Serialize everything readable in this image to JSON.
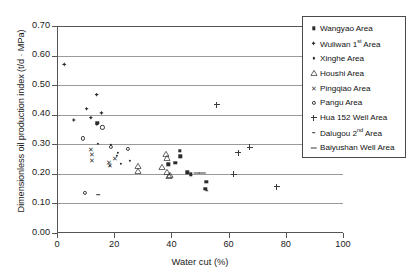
{
  "chart": {
    "type": "scatter",
    "title": "",
    "xlabel": "Water cut (%)",
    "ylabel": "Dimensionless oil production index (t/d · MPa)",
    "xlim": [
      0,
      100
    ],
    "ylim": [
      0.0,
      0.7
    ],
    "xticks": [
      "0",
      "20",
      "40",
      "60",
      "80",
      "100"
    ],
    "yticks": [
      "0.00",
      "0.10",
      "0.20",
      "0.30",
      "0.40",
      "0.50",
      "0.60",
      "0.70"
    ],
    "grid": "horizontal",
    "legend_position": "top-right"
  },
  "legend": {
    "items": [
      {
        "label": "Wangyao Area",
        "marker": "filled-square",
        "key": "wangyao"
      },
      {
        "label": "Wuliwan 1",
        "sup": "st",
        "label_tail": " Area",
        "marker": "filled-diamond",
        "key": "wuliwan"
      },
      {
        "label": "Xinghe Area",
        "marker": "small-dot",
        "key": "xinghe"
      },
      {
        "label": "Houshi Area",
        "marker": "open-triangle",
        "key": "houshi"
      },
      {
        "label": "Pingqiao Area",
        "marker": "x-cross",
        "key": "pingqiao"
      },
      {
        "label": "Pangu Area",
        "marker": "open-circle",
        "key": "pangu"
      },
      {
        "label": "Hua 152 Well Area",
        "marker": "plus",
        "key": "hua152"
      },
      {
        "label": "Dalugou 2",
        "sup": "nd",
        "label_tail": " Area",
        "marker": "short-dash",
        "key": "dalugou"
      },
      {
        "label": "Baiyushan Well Area",
        "marker": "long-dash",
        "key": "baiyushan"
      }
    ]
  },
  "chart_data": {
    "type": "scatter",
    "title": "",
    "xlabel": "Water cut (%)",
    "ylabel": "Dimensionless oil production index (t/d · MPa)",
    "xlim": [
      0,
      100
    ],
    "ylim": [
      0.0,
      0.7
    ],
    "grid": true,
    "legend_position": "top-right",
    "series": [
      {
        "name": "Wangyao Area",
        "marker": "filled-square",
        "points": [
          [
            38.5,
            0.232
          ],
          [
            42.5,
            0.277
          ],
          [
            42.8,
            0.26
          ],
          [
            41.0,
            0.238
          ],
          [
            45.2,
            0.205
          ],
          [
            46.5,
            0.198
          ],
          [
            51.8,
            0.173
          ],
          [
            51.5,
            0.15
          ],
          [
            13.8,
            0.373
          ]
        ]
      },
      {
        "name": "Wuliwan 1st Area",
        "marker": "filled-diamond",
        "points": [
          [
            2.2,
            0.57
          ],
          [
            5.5,
            0.382
          ],
          [
            10.0,
            0.42
          ],
          [
            11.5,
            0.39
          ],
          [
            13.5,
            0.468
          ],
          [
            15.2,
            0.406
          ],
          [
            13.6,
            0.368
          ]
        ]
      },
      {
        "name": "Xinghe Area",
        "marker": "small-dot",
        "points": [
          [
            14.0,
            0.302
          ],
          [
            18.5,
            0.297
          ],
          [
            18.2,
            0.228
          ],
          [
            20.5,
            0.262
          ],
          [
            21.0,
            0.27
          ],
          [
            22.0,
            0.234
          ],
          [
            25.0,
            0.243
          ]
        ]
      },
      {
        "name": "Houshi Area",
        "marker": "open-triangle",
        "points": [
          [
            27.8,
            0.228
          ],
          [
            28.0,
            0.211
          ],
          [
            36.5,
            0.222
          ],
          [
            37.8,
            0.268
          ],
          [
            38.2,
            0.252
          ],
          [
            38.0,
            0.205
          ],
          [
            38.8,
            0.193
          ],
          [
            39.0,
            0.196
          ]
        ]
      },
      {
        "name": "Pingqiao Area",
        "marker": "x-cross",
        "points": [
          [
            11.5,
            0.283
          ],
          [
            11.8,
            0.268
          ],
          [
            12.0,
            0.246
          ],
          [
            17.8,
            0.24
          ],
          [
            18.2,
            0.229
          ],
          [
            20.0,
            0.252
          ]
        ]
      },
      {
        "name": "Pangu Area",
        "marker": "open-circle",
        "points": [
          [
            8.8,
            0.32
          ],
          [
            15.5,
            0.357
          ],
          [
            18.6,
            0.292
          ],
          [
            24.5,
            0.285
          ],
          [
            9.5,
            0.135
          ]
        ]
      },
      {
        "name": "Hua 152 Well Area",
        "marker": "plus",
        "points": [
          [
            55.5,
            0.434
          ],
          [
            63.0,
            0.272
          ],
          [
            67.0,
            0.29
          ],
          [
            61.5,
            0.199
          ],
          [
            76.5,
            0.157
          ]
        ]
      },
      {
        "name": "Dalugou 2nd Area",
        "marker": "short-dash",
        "points": [
          [
            14.0,
            0.13
          ],
          [
            52.0,
            0.143
          ]
        ]
      },
      {
        "name": "Baiyushan Well Area",
        "marker": "long-dash",
        "points": [
          [
            48.5,
            0.202
          ],
          [
            50.5,
            0.202
          ]
        ]
      }
    ]
  }
}
